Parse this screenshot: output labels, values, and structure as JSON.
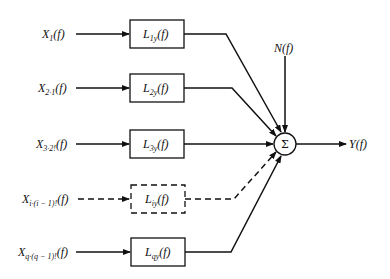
{
  "diagram": {
    "type": "block-diagram",
    "inputs": [
      {
        "label": "X",
        "sub": "1",
        "arg": "(f)",
        "dashed": false
      },
      {
        "label": "X",
        "sub": "2·1",
        "arg": "(f)",
        "dashed": false
      },
      {
        "label": "X",
        "sub": "3·2!",
        "arg": "(f)",
        "dashed": false
      },
      {
        "label": "X",
        "sub": "i·(i − 1)!",
        "arg": "(f)",
        "dashed": true
      },
      {
        "label": "X",
        "sub": "q·(q − 1)!",
        "arg": "(f)",
        "dashed": false
      }
    ],
    "blocks": [
      {
        "label": "L",
        "sub": "1y",
        "arg": "(f)",
        "dashed": false
      },
      {
        "label": "L",
        "sub": "2y",
        "arg": "(f)",
        "dashed": false
      },
      {
        "label": "L",
        "sub": "3y",
        "arg": "(f)",
        "dashed": false
      },
      {
        "label": "L",
        "sub": "iy",
        "arg": "(f)",
        "dashed": true
      },
      {
        "label": "L",
        "sub": "qy",
        "arg": "(f)",
        "dashed": false
      }
    ],
    "noise": {
      "label": "N(f)"
    },
    "summer": {
      "symbol": "Σ"
    },
    "output": {
      "label": "Y(f)"
    }
  }
}
